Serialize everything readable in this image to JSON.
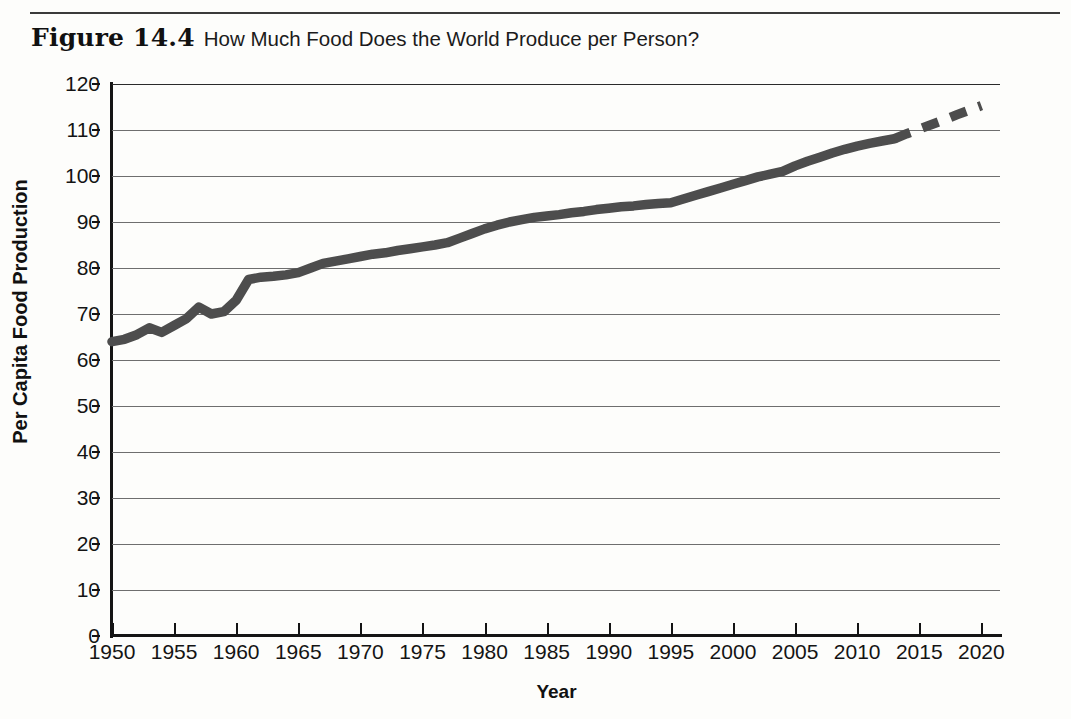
{
  "figure": {
    "number": "Figure 14.4",
    "title": "How Much Food Does the World Produce per Person?"
  },
  "chart_data": {
    "type": "line",
    "title": "How Much Food Does the World Produce per Person?",
    "xlabel": "Year",
    "ylabel": "Per Capita Food Production",
    "xlim": [
      1950,
      2021.5
    ],
    "ylim": [
      0,
      120
    ],
    "xticks": [
      1950,
      1955,
      1960,
      1965,
      1970,
      1975,
      1980,
      1985,
      1990,
      1995,
      2000,
      2005,
      2010,
      2015,
      2020
    ],
    "xtick_labels": [
      "1950",
      "1955",
      "1960",
      "1965",
      "1970",
      "1975",
      "1980",
      "1985",
      "1990",
      "1995",
      "2000",
      "2005",
      "2010",
      "2015",
      "2020"
    ],
    "yticks": [
      0,
      10,
      20,
      30,
      40,
      50,
      60,
      70,
      80,
      90,
      100,
      110,
      120
    ],
    "ytick_labels": [
      "0",
      "10",
      "20",
      "30",
      "40",
      "50",
      "60",
      "70",
      "80",
      "90",
      "100",
      "110",
      "120"
    ],
    "grid": "horizontal",
    "legend": "none",
    "line_color": "#4d4d4d",
    "series": [
      {
        "name": "Per capita food production (observed)",
        "style": "solid",
        "x": [
          1950,
          1951,
          1952,
          1953,
          1954,
          1955,
          1956,
          1957,
          1958,
          1959,
          1960,
          1961,
          1962,
          1963,
          1964,
          1965,
          1966,
          1967,
          1968,
          1969,
          1970,
          1971,
          1972,
          1973,
          1974,
          1975,
          1976,
          1977,
          1978,
          1979,
          1980,
          1981,
          1982,
          1983,
          1984,
          1985,
          1986,
          1987,
          1988,
          1989,
          1990,
          1991,
          1992,
          1993,
          1994,
          1995,
          1996,
          1997,
          1998,
          1999,
          2000,
          2001,
          2002,
          2003,
          2004,
          2005,
          2006,
          2007,
          2008,
          2009,
          2010,
          2011,
          2012,
          2013
        ],
        "y": [
          64.0,
          64.5,
          65.5,
          67.0,
          66.0,
          67.5,
          69.0,
          71.5,
          70.0,
          70.5,
          73.0,
          77.5,
          78.0,
          78.2,
          78.5,
          79.0,
          80.0,
          81.0,
          81.5,
          82.0,
          82.5,
          83.0,
          83.3,
          83.8,
          84.2,
          84.6,
          85.0,
          85.5,
          86.5,
          87.5,
          88.5,
          89.3,
          90.0,
          90.5,
          91.0,
          91.3,
          91.6,
          92.0,
          92.3,
          92.7,
          93.0,
          93.3,
          93.5,
          93.8,
          94.0,
          94.2,
          95.0,
          95.8,
          96.6,
          97.4,
          98.2,
          99.0,
          99.8,
          100.4,
          101.0,
          102.2,
          103.2,
          104.1,
          105.0,
          105.8,
          106.5,
          107.1,
          107.6,
          108.1
        ]
      },
      {
        "name": "Per capita food production (projected)",
        "style": "dashed",
        "x": [
          2013,
          2014,
          2015,
          2016,
          2017,
          2018,
          2019,
          2020
        ],
        "y": [
          108.1,
          109.2,
          110.2,
          111.2,
          112.2,
          113.3,
          114.3,
          115.3
        ]
      }
    ]
  }
}
